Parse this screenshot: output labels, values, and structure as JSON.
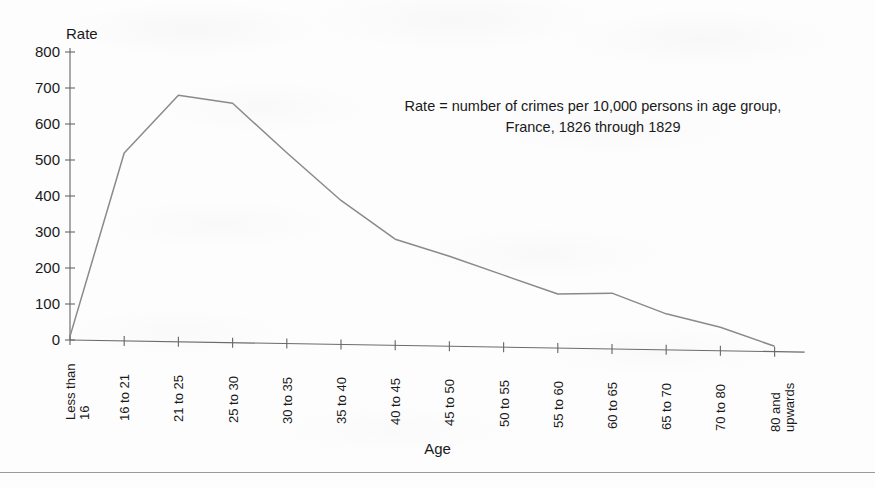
{
  "chart_data": {
    "type": "line",
    "title": "",
    "xlabel": "Age",
    "ylabel": "Rate",
    "ylim": [
      0,
      800
    ],
    "ytick_step": 100,
    "grid": false,
    "legend": "none",
    "annotation": "Rate = number of crimes per 10,000 persons in age group, France, 1826 through 1829",
    "annotation_lines": [
      "Rate = number of crimes per 10,000 persons in age group,",
      "France, 1826 through 1829"
    ],
    "categories": [
      "Less than 16",
      "16 to 21",
      "21 to 25",
      "25 to 30",
      "30 to 35",
      "35 to 40",
      "40 to 45",
      "45 to 50",
      "50 to 55",
      "55 to 60",
      "60 to 65",
      "65 to 70",
      "70 to 80",
      "80 and upwards"
    ],
    "category_lines": [
      [
        "Less than",
        "16"
      ],
      [
        "16 to 21"
      ],
      [
        "21 to 25"
      ],
      [
        "25 to 30"
      ],
      [
        "30 to 35"
      ],
      [
        "35 to 40"
      ],
      [
        "40 to 45"
      ],
      [
        "45 to 50"
      ],
      [
        "50 to 55"
      ],
      [
        "55 to 60"
      ],
      [
        "60 to 65"
      ],
      [
        "65 to 70"
      ],
      [
        "70 to 80"
      ],
      [
        "80 and",
        "upwards"
      ]
    ],
    "values": [
      10,
      522,
      685,
      665,
      530,
      400,
      295,
      250,
      200,
      150,
      155,
      100,
      65,
      15
    ],
    "yticks": [
      0,
      100,
      200,
      300,
      400,
      500,
      600,
      700,
      800
    ],
    "ytick_labels": [
      "0",
      "100",
      "200",
      "300",
      "400",
      "500",
      "600",
      "700",
      "800"
    ],
    "series_color": "#8a8a8a",
    "axis_color": "#6b6b6b"
  }
}
